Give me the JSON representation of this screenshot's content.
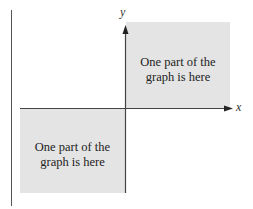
{
  "diagram": {
    "type": "coordinate-plane-regions",
    "axes": {
      "x_label": "x",
      "y_label": "y"
    },
    "regions": [
      {
        "quadrant": "I",
        "text_line1": "One part of the",
        "text_line2": "graph is here",
        "fill": "#e4e4e4"
      },
      {
        "quadrant": "III",
        "text_line1": "One part of the",
        "text_line2": "graph is here",
        "fill": "#e4e4e4"
      }
    ],
    "colors": {
      "axis": "#444444",
      "region_fill": "#e4e4e4",
      "text": "#222222"
    }
  }
}
